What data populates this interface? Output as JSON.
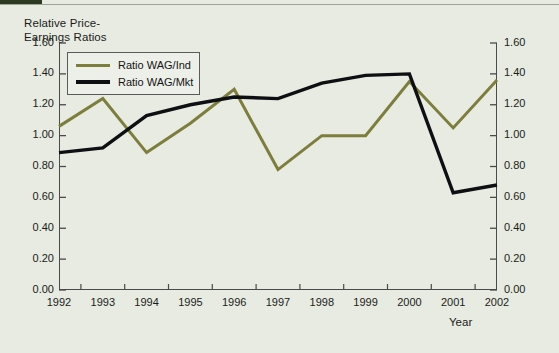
{
  "header": {
    "accent_bar_color": "#2d3a21",
    "rule_color": "#9aa593"
  },
  "chart_data": {
    "type": "line",
    "title_line1": "Relative Price-",
    "title_line2": "Earnings Ratios",
    "xlabel": "Year",
    "ylabel": "",
    "categories": [
      "1992",
      "1993",
      "1994",
      "1995",
      "1996",
      "1997",
      "1998",
      "1999",
      "2000",
      "2001",
      "2002"
    ],
    "x": [
      1992,
      1993,
      1994,
      1995,
      1996,
      1997,
      1998,
      1999,
      2000,
      2001,
      2002
    ],
    "ylim": [
      0.0,
      1.6
    ],
    "xlim": [
      1992,
      2002
    ],
    "ytick_labels": [
      "0.00",
      "0.20",
      "0.40",
      "0.60",
      "0.80",
      "1.00",
      "1.20",
      "1.40",
      "1.60"
    ],
    "ytick_values": [
      0.0,
      0.2,
      0.4,
      0.6,
      0.8,
      1.0,
      1.2,
      1.4,
      1.6
    ],
    "grid": false,
    "legend_position": "top-left-inside",
    "series": [
      {
        "name": "Ratio WAG/Ind",
        "color": "#7d7d3c",
        "values": [
          1.06,
          1.24,
          0.89,
          1.08,
          1.3,
          0.78,
          1.0,
          1.0,
          1.35,
          1.05,
          1.36
        ]
      },
      {
        "name": "Ratio WAG/Mkt",
        "color": "#0d0f12",
        "values": [
          0.89,
          0.92,
          1.13,
          1.2,
          1.25,
          1.24,
          1.34,
          1.39,
          1.4,
          0.63,
          0.68
        ]
      }
    ]
  }
}
